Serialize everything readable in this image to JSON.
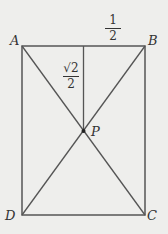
{
  "figure": {
    "vertices": {
      "A": "A",
      "B": "B",
      "C": "C",
      "D": "D",
      "P": "P"
    },
    "labels": {
      "half": {
        "num": "1",
        "den": "2"
      },
      "root2_over_2": {
        "num": "√2",
        "den": "2"
      }
    },
    "colors": {
      "line": "#555555",
      "background": "#eeeeec"
    }
  }
}
